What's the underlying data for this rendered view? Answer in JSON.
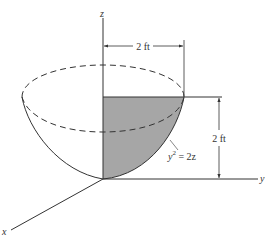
{
  "diagram": {
    "type": "paraboloid-of-revolution",
    "axes": {
      "x_label": "x",
      "y_label": "y",
      "z_label": "z"
    },
    "dimensions": {
      "radius_label": "2 ft",
      "height_label": "2 ft"
    },
    "curve": {
      "equation_lhs": "y",
      "equation_exp": "2",
      "equation_rhs": " = 2z"
    },
    "colors": {
      "line": "#333333",
      "shade": "#a6a6a6",
      "background": "#ffffff"
    }
  }
}
